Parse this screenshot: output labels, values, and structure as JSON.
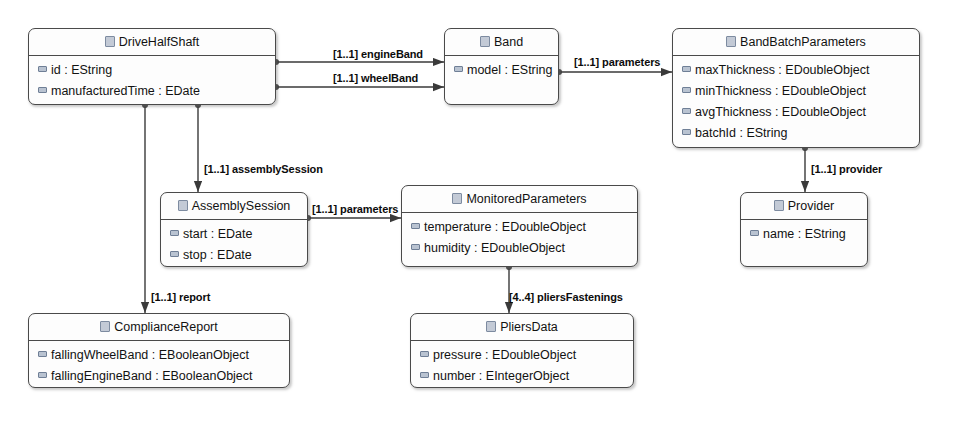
{
  "diagram": {
    "type": "ecore-class-diagram",
    "background_color": "#ffffff",
    "box_border_color": "#4a4a4a",
    "edge_color": "#3a3a3a",
    "class_icon_name": "ecore-class-icon",
    "attribute_icon_name": "ecore-attribute-icon"
  },
  "classes": [
    {
      "id": "DriveHalfShaft",
      "name": "DriveHalfShaft",
      "x": 28,
      "y": 28,
      "w": 248,
      "h": 77,
      "attributes": [
        "id : EString",
        "manufacturedTime : EDate"
      ]
    },
    {
      "id": "Band",
      "name": "Band",
      "x": 444,
      "y": 28,
      "w": 115,
      "h": 77,
      "attributes": [
        "model : EString"
      ]
    },
    {
      "id": "BandBatchParameters",
      "name": "BandBatchParameters",
      "x": 672,
      "y": 28,
      "w": 248,
      "h": 120,
      "attributes": [
        "maxThickness : EDoubleObject",
        "minThickness : EDoubleObject",
        "avgThickness : EDoubleObject",
        "batchId : EString"
      ]
    },
    {
      "id": "AssemblySession",
      "name": "AssemblySession",
      "x": 160,
      "y": 192,
      "w": 148,
      "h": 75,
      "attributes": [
        "start : EDate",
        "stop : EDate"
      ]
    },
    {
      "id": "MonitoredParameters",
      "name": "MonitoredParameters",
      "x": 401,
      "y": 185,
      "w": 237,
      "h": 82,
      "attributes": [
        "temperature : EDoubleObject",
        "humidity : EDoubleObject"
      ]
    },
    {
      "id": "Provider",
      "name": "Provider",
      "x": 740,
      "y": 192,
      "w": 128,
      "h": 75,
      "attributes": [
        "name : EString"
      ]
    },
    {
      "id": "ComplianceReport",
      "name": "ComplianceReport",
      "x": 28,
      "y": 313,
      "w": 262,
      "h": 75,
      "attributes": [
        "fallingWheelBand : EBooleanObject",
        "fallingEngineBand : EBooleanObject"
      ]
    },
    {
      "id": "PliersData",
      "name": "PliersData",
      "x": 410,
      "y": 313,
      "w": 224,
      "h": 75,
      "attributes": [
        "pressure : EDoubleObject",
        "number : EIntegerObject"
      ]
    }
  ],
  "edges": [
    {
      "id": "engineBand",
      "source": "DriveHalfShaft",
      "target": "Band",
      "multiplicity": "[1..1]",
      "role": "engineBand",
      "label": "[1..1] engineBand",
      "label_x": 333,
      "label_y": 48
    },
    {
      "id": "wheelBand",
      "source": "DriveHalfShaft",
      "target": "Band",
      "multiplicity": "[1..1]",
      "role": "wheelBand",
      "label": "[1..1] wheelBand",
      "label_x": 333,
      "label_y": 72
    },
    {
      "id": "parameters-band",
      "source": "Band",
      "target": "BandBatchParameters",
      "multiplicity": "[1..1]",
      "role": "parameters",
      "label": "[1..1] parameters",
      "label_x": 574,
      "label_y": 56
    },
    {
      "id": "assemblySession",
      "source": "DriveHalfShaft",
      "target": "AssemblySession",
      "multiplicity": "[1..1]",
      "role": "assemblySession",
      "label": "[1..1] assemblySession",
      "label_x": 204,
      "label_y": 163
    },
    {
      "id": "parameters-assembly",
      "source": "AssemblySession",
      "target": "MonitoredParameters",
      "multiplicity": "[1..1]",
      "role": "parameters",
      "label": "[1..1] parameters",
      "label_x": 312,
      "label_y": 203
    },
    {
      "id": "provider",
      "source": "BandBatchParameters",
      "target": "Provider",
      "multiplicity": "[1..1]",
      "role": "provider",
      "label": "[1..1] provider",
      "label_x": 811,
      "label_y": 163
    },
    {
      "id": "report",
      "source": "DriveHalfShaft",
      "target": "ComplianceReport",
      "multiplicity": "[1..1]",
      "role": "report",
      "label": "[1..1] report",
      "label_x": 151,
      "label_y": 291
    },
    {
      "id": "pliersFastenings",
      "source": "MonitoredParameters",
      "target": "PliersData",
      "multiplicity": "[4..4]",
      "role": "pliersFastenings",
      "label": "[4..4] pliersFastenings",
      "label_x": 509,
      "label_y": 291
    }
  ]
}
